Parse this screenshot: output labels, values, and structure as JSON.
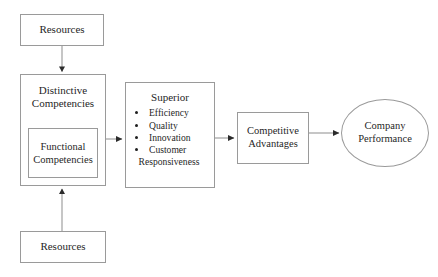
{
  "diagram": {
    "line_color": "#9a9a9a",
    "text_color": "#1f1f1f",
    "background": "#ffffff",
    "nodes": {
      "resources_top": {
        "label": "Resources",
        "shape": "rectangle"
      },
      "resources_bottom": {
        "label": "Resources",
        "shape": "rectangle"
      },
      "distinctive": {
        "label": "Distinctive\nCompetencies",
        "shape": "rectangle"
      },
      "functional": {
        "label": "Functional\nCompetencies",
        "shape": "rectangle"
      },
      "superior": {
        "title": "Superior",
        "shape": "rectangle",
        "items": [
          {
            "text": "Efficiency",
            "wraps": false
          },
          {
            "text": "Quality",
            "wraps": false
          },
          {
            "text": "Innovation",
            "wraps": false
          },
          {
            "text": "Customer",
            "second_line": "Responsiveness",
            "wraps": true
          }
        ]
      },
      "competitive": {
        "label": "Competitive\nAdvantages",
        "shape": "rectangle"
      },
      "company": {
        "label": "Company\nPerformance",
        "shape": "ellipse"
      }
    },
    "connectors": [
      {
        "from": "resources_top",
        "to": "distinctive",
        "direction": "down"
      },
      {
        "from": "resources_bottom",
        "to": "distinctive",
        "direction": "up"
      },
      {
        "from": "distinctive",
        "to": "superior",
        "direction": "right"
      },
      {
        "from": "superior",
        "to": "competitive",
        "direction": "right"
      },
      {
        "from": "competitive",
        "to": "company",
        "direction": "right"
      }
    ]
  }
}
